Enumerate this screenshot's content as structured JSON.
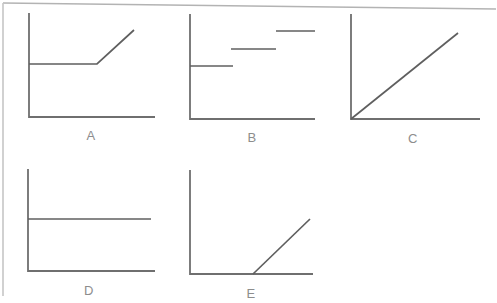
{
  "figure": {
    "labels": [
      "A",
      "B",
      "C",
      "D",
      "E"
    ]
  },
  "style": {
    "background": "#ffffff",
    "border_color": "#b3b3b3",
    "axis_color": "#6f6f6f",
    "curve_color": "#5f5f5f",
    "label_color": "#8d8d8d"
  },
  "charts": [
    {
      "label": "A",
      "type": "line-sketch",
      "trend": "constant then increasing",
      "axis": {
        "top": [
          29,
          13
        ],
        "origin": [
          29,
          117
        ],
        "right": [
          155,
          117
        ]
      },
      "polylines": [
        [
          [
            29,
            64
          ],
          [
            97,
            64
          ],
          [
            134,
            30
          ]
        ]
      ]
    },
    {
      "label": "B",
      "type": "line-sketch",
      "trend": "increasing step segments",
      "axis": {
        "top": [
          190,
          14
        ],
        "origin": [
          190,
          119
        ],
        "right": [
          315,
          119
        ]
      },
      "polylines": [
        [
          [
            190,
            66
          ],
          [
            233,
            66
          ]
        ],
        [
          [
            231,
            49
          ],
          [
            276,
            49
          ]
        ],
        [
          [
            276,
            31
          ],
          [
            315,
            31
          ]
        ]
      ]
    },
    {
      "label": "C",
      "type": "line-sketch",
      "trend": "linear increase from origin",
      "axis": {
        "top": [
          351,
          14
        ],
        "origin": [
          351,
          119
        ],
        "right": [
          480,
          119
        ]
      },
      "polylines": [
        [
          [
            351,
            119
          ],
          [
            458,
            33
          ]
        ]
      ]
    },
    {
      "label": "D",
      "type": "line-sketch",
      "trend": "constant",
      "axis": {
        "top": [
          28,
          169
        ],
        "origin": [
          28,
          271
        ],
        "right": [
          155,
          271
        ]
      },
      "polylines": [
        [
          [
            28,
            219
          ],
          [
            151,
            219
          ]
        ]
      ]
    },
    {
      "label": "E",
      "type": "line-sketch",
      "trend": "zero then linear increase",
      "axis": {
        "top": [
          190,
          170
        ],
        "origin": [
          190,
          274
        ],
        "right": [
          313,
          274
        ]
      },
      "polylines": [
        [
          [
            253,
            274
          ],
          [
            310,
            219
          ]
        ]
      ]
    }
  ]
}
